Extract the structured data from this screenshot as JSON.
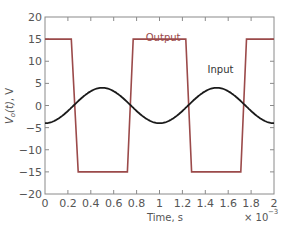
{
  "chart_data": {
    "type": "line",
    "title": "",
    "xlabel": "Time, s",
    "ylabel": "V_o(t), V",
    "x_multiplier": "× 10^-3",
    "xlim": [
      0,
      2
    ],
    "ylim": [
      -20,
      20
    ],
    "x_ticks": [
      0,
      0.2,
      0.4,
      0.6,
      0.8,
      1,
      1.2,
      1.4,
      1.6,
      1.8,
      2
    ],
    "x_tick_labels": [
      "0",
      "0.2",
      "0.4",
      "0.6",
      "0.8",
      "1",
      "1.2",
      "1.4",
      "1.6",
      "1.8",
      "2"
    ],
    "y_ticks": [
      -20,
      -15,
      -10,
      -5,
      0,
      5,
      10,
      15,
      20
    ],
    "y_tick_labels": [
      "-20",
      "-15",
      "-10",
      "-5",
      "0",
      "5",
      "10",
      "15",
      "20"
    ],
    "grid": false,
    "legend": "inline annotations",
    "series": [
      {
        "name": "Output",
        "color": "#9b4a4a",
        "x": [
          0,
          0.23,
          0.29,
          0.72,
          0.77,
          1.23,
          1.28,
          1.71,
          1.76,
          2.0
        ],
        "y": [
          15,
          15,
          -15,
          -15,
          15,
          15,
          -15,
          -15,
          15,
          15
        ]
      },
      {
        "name": "Input",
        "color": "#1a1a1a",
        "function": "-4*cos(2*pi*1000*t)",
        "amplitude": 4,
        "frequency_hz": 1000,
        "x": [
          0,
          0.25,
          0.5,
          0.75,
          1.0,
          1.25,
          1.5,
          1.75,
          2.0
        ],
        "y": [
          -4,
          0,
          4,
          0,
          -4,
          0,
          4,
          0,
          -4
        ]
      }
    ],
    "annotations": [
      {
        "text": "Output",
        "x": 0.88,
        "y": 14.5,
        "color": "#9b4a4a"
      },
      {
        "text": "Input",
        "x": 1.42,
        "y": 7.3,
        "color": "#333333"
      }
    ]
  }
}
